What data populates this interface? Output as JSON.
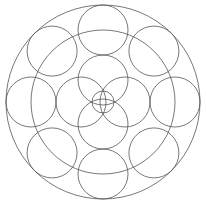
{
  "diagram": {
    "type": "geometric-circle-pattern",
    "width": 206,
    "height": 204,
    "stroke_color": "#555555",
    "background": "#ffffff",
    "center": [
      103,
      102
    ],
    "outer_circle": {
      "r": 97
    },
    "middle_circle": {
      "r": 72
    },
    "ring": {
      "count": 8,
      "distance": 72,
      "r": 25,
      "start_angle_deg": -90
    },
    "inner": {
      "count": 4,
      "distance": 22,
      "r": 25,
      "start_angle_deg": -90
    },
    "center_circle": {
      "r": 11
    }
  }
}
